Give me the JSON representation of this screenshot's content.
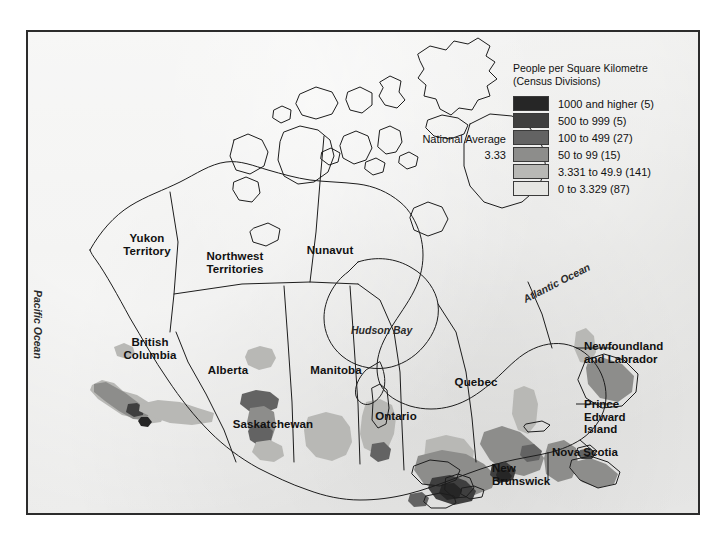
{
  "figure": {
    "type": "choropleth-map",
    "region": "Canada",
    "background_color": "#e9e9e7",
    "border_color": "#2c2c2c"
  },
  "legend": {
    "title": "People per Square Kilometre\n(Census Divisions)",
    "national_average": "National Average\n3.33",
    "national_average_label": "National Average",
    "national_average_value": "3.33",
    "classes": [
      {
        "label": "1000 and higher (5)",
        "range": "1000 and higher",
        "count": 5,
        "color": "#262626"
      },
      {
        "label": "500 to 999 (5)",
        "range": "500 to 999",
        "count": 5,
        "color": "#3f3f3f"
      },
      {
        "label": "100 to 499 (27)",
        "range": "100 to 499",
        "count": 27,
        "color": "#636363"
      },
      {
        "label": "50 to 99 (15)",
        "range": "50 to 99",
        "count": 15,
        "color": "#8d8d8b"
      },
      {
        "label": "3.331 to 49.9 (141)",
        "range": "3.331 to 49.9",
        "count": 141,
        "color": "#b8b8b5"
      },
      {
        "label": "0 to 3.329 (87)",
        "range": "0 to 3.329",
        "count": 87,
        "color": "#e6e6e3"
      }
    ]
  },
  "provinces": [
    {
      "name": "Yukon Territory",
      "label": "Yukon\nTerritory"
    },
    {
      "name": "Northwest Territories",
      "label": "Northwest\nTerritories"
    },
    {
      "name": "Nunavut",
      "label": "Nunavut"
    },
    {
      "name": "British Columbia",
      "label": "British\nColumbia"
    },
    {
      "name": "Alberta",
      "label": "Alberta"
    },
    {
      "name": "Saskatchewan",
      "label": "Saskatchewan"
    },
    {
      "name": "Manitoba",
      "label": "Manitoba"
    },
    {
      "name": "Ontario",
      "label": "Ontario"
    },
    {
      "name": "Quebec",
      "label": "Quebec"
    },
    {
      "name": "Newfoundland and Labrador",
      "label": "Newfoundland\nand Labrador"
    },
    {
      "name": "Prince Edward Island",
      "label": "Prince\nEdward\nIsland"
    },
    {
      "name": "Nova Scotia",
      "label": "Nova Scotia"
    },
    {
      "name": "New Brunswick",
      "label": "New\nBrunswick"
    }
  ],
  "water_labels": [
    {
      "name": "Pacific Ocean",
      "label": "Pacific Ocean"
    },
    {
      "name": "Atlantic Ocean",
      "label": "Atlantic Ocean"
    },
    {
      "name": "Hudson Bay",
      "label": "Hudson Bay"
    }
  ],
  "footer": {
    "fragment": ""
  }
}
